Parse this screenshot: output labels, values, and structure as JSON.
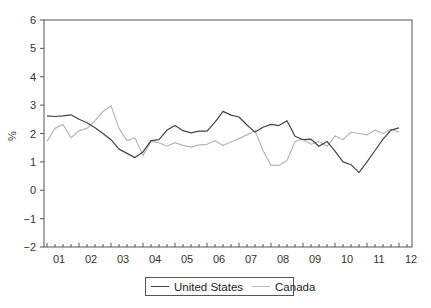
{
  "chart_data": {
    "type": "line",
    "title": "",
    "xlabel": "",
    "ylabel": "%",
    "ylim": [
      -2,
      6
    ],
    "yticks": [
      -2,
      -1,
      0,
      1,
      2,
      3,
      4,
      5,
      6
    ],
    "xtick_labels": [
      "01",
      "02",
      "03",
      "04",
      "05",
      "06",
      "07",
      "08",
      "09",
      "10",
      "11",
      "12"
    ],
    "grid": false,
    "legend_position": "bottom-center",
    "frequency": "quarterly",
    "x": [
      "2001Q1",
      "2001Q2",
      "2001Q3",
      "2001Q4",
      "2002Q1",
      "2002Q2",
      "2002Q3",
      "2002Q4",
      "2003Q1",
      "2003Q2",
      "2003Q3",
      "2003Q4",
      "2004Q1",
      "2004Q2",
      "2004Q3",
      "2004Q4",
      "2005Q1",
      "2005Q2",
      "2005Q3",
      "2005Q4",
      "2006Q1",
      "2006Q2",
      "2006Q3",
      "2006Q4",
      "2007Q1",
      "2007Q2",
      "2007Q3",
      "2007Q4",
      "2008Q1",
      "2008Q2",
      "2008Q3",
      "2008Q4",
      "2009Q1",
      "2009Q2",
      "2009Q3",
      "2009Q4",
      "2010Q1",
      "2010Q2",
      "2010Q3",
      "2010Q4",
      "2011Q1",
      "2011Q2",
      "2011Q3",
      "2011Q4",
      "2012Q1"
    ],
    "series": [
      {
        "name": "United States",
        "color": "#444444",
        "values": [
          2.62,
          2.6,
          2.62,
          2.66,
          2.5,
          2.38,
          2.2,
          2.0,
          1.78,
          1.45,
          1.3,
          1.15,
          1.35,
          1.75,
          1.78,
          2.12,
          2.28,
          2.1,
          2.02,
          2.08,
          2.08,
          2.4,
          2.78,
          2.65,
          2.58,
          2.3,
          2.05,
          2.22,
          2.32,
          2.28,
          2.45,
          1.9,
          1.78,
          1.8,
          1.55,
          1.72,
          1.38,
          1.0,
          0.9,
          0.62,
          1.0,
          1.4,
          1.8,
          2.12,
          2.2
        ]
      },
      {
        "name": "Canada",
        "color": "#b8b8b8",
        "values": [
          1.72,
          2.18,
          2.32,
          1.85,
          2.1,
          2.18,
          2.45,
          2.78,
          2.98,
          2.18,
          1.75,
          1.85,
          1.22,
          1.72,
          1.68,
          1.55,
          1.68,
          1.58,
          1.52,
          1.6,
          1.62,
          1.75,
          1.58,
          1.7,
          1.82,
          1.95,
          2.1,
          1.4,
          0.88,
          0.88,
          1.05,
          1.72,
          1.8,
          1.62,
          1.72,
          1.55,
          1.92,
          1.78,
          2.05,
          2.0,
          1.95,
          2.12,
          2.0,
          2.15,
          2.05
        ]
      }
    ]
  },
  "legend": {
    "items": [
      {
        "label": "United States",
        "color": "#444444"
      },
      {
        "label": "Canada",
        "color": "#b8b8b8"
      }
    ]
  }
}
